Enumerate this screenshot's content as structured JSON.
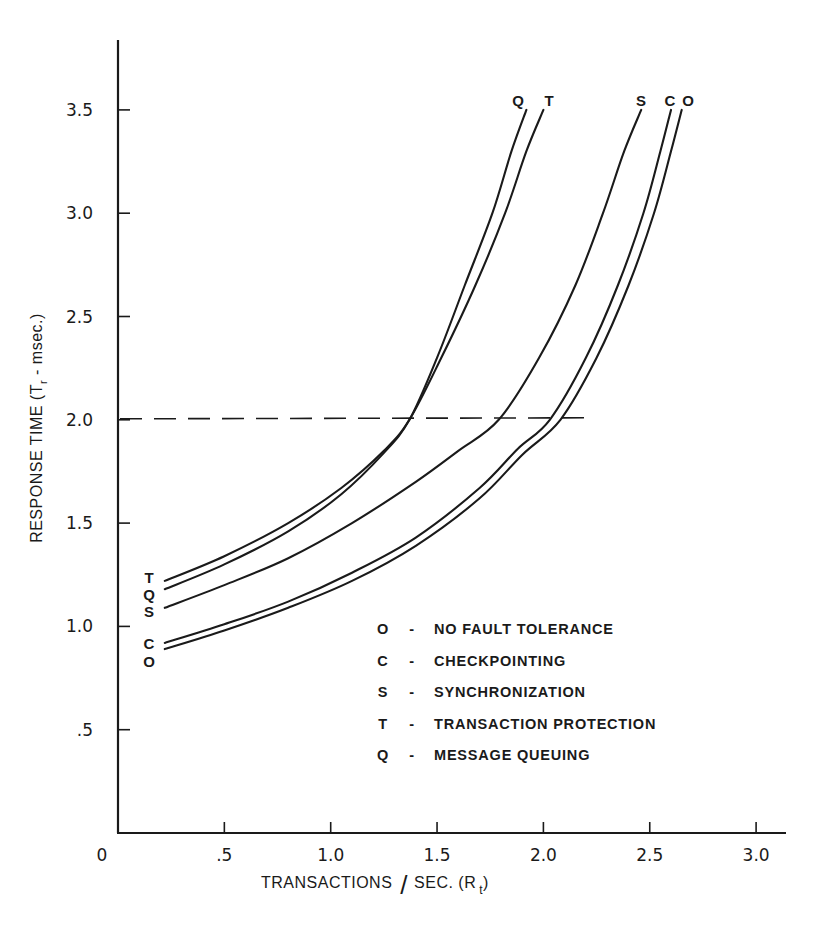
{
  "chart_data": {
    "type": "line",
    "title": "",
    "xlabel": "TRANSACTIONS / SEC. (R_t)",
    "xlabel_main": "TRANSACTIONS",
    "xlabel_slash": "/",
    "xlabel_unit": "SEC. (R",
    "xlabel_sub": "t",
    "xlabel_close": ")",
    "ylabel": "RESPONSE TIME (T_r - msec.)",
    "ylabel_main": "RESPONSE TIME (T",
    "ylabel_sub": "r",
    "ylabel_rest": " - msec.)",
    "xlim": [
      0,
      3.1
    ],
    "ylim": [
      0,
      3.8
    ],
    "grid": false,
    "x_ticks": [
      {
        "value": 0,
        "label": "0"
      },
      {
        "value": 0.5,
        "label": ".5"
      },
      {
        "value": 1.0,
        "label": "1.0"
      },
      {
        "value": 1.5,
        "label": "1.5"
      },
      {
        "value": 2.0,
        "label": "2.0"
      },
      {
        "value": 2.5,
        "label": "2.5"
      },
      {
        "value": 3.0,
        "label": "3.0"
      }
    ],
    "y_ticks": [
      {
        "value": 0.5,
        "label": ".5"
      },
      {
        "value": 1.0,
        "label": "1.0"
      },
      {
        "value": 1.5,
        "label": "1.5"
      },
      {
        "value": 2.0,
        "label": "2.0"
      },
      {
        "value": 2.5,
        "label": "2.5"
      },
      {
        "value": 3.0,
        "label": "3.0"
      },
      {
        "value": 3.5,
        "label": "3.5"
      }
    ],
    "reference_line": {
      "type": "horizontal",
      "style": "dashed",
      "y": 2.0,
      "x_start": 0,
      "x_end": 2.22
    },
    "series": [
      {
        "key": "O",
        "name": "NO FAULT TOLERANCE",
        "x": [
          0.22,
          0.5,
          0.8,
          1.1,
          1.4,
          1.7,
          1.9,
          2.08,
          2.25,
          2.4,
          2.52,
          2.6,
          2.65
        ],
        "y": [
          0.89,
          0.98,
          1.09,
          1.22,
          1.39,
          1.62,
          1.83,
          2.0,
          2.3,
          2.65,
          3.0,
          3.3,
          3.5
        ]
      },
      {
        "key": "C",
        "name": "CHECKPOINTING",
        "x": [
          0.22,
          0.5,
          0.8,
          1.1,
          1.4,
          1.7,
          1.88,
          2.03,
          2.2,
          2.35,
          2.47,
          2.55,
          2.6
        ],
        "y": [
          0.92,
          1.01,
          1.12,
          1.26,
          1.43,
          1.67,
          1.86,
          2.0,
          2.3,
          2.65,
          3.0,
          3.3,
          3.5
        ]
      },
      {
        "key": "S",
        "name": "SYNCHRONIZATION",
        "x": [
          0.22,
          0.5,
          0.8,
          1.1,
          1.4,
          1.6,
          1.79,
          1.98,
          2.15,
          2.28,
          2.38,
          2.46
        ],
        "y": [
          1.09,
          1.2,
          1.33,
          1.5,
          1.7,
          1.85,
          2.0,
          2.3,
          2.65,
          3.0,
          3.3,
          3.5
        ]
      },
      {
        "key": "T",
        "name": "TRANSACTION PROTECTION",
        "x": [
          0.22,
          0.5,
          0.8,
          1.05,
          1.25,
          1.37,
          1.52,
          1.68,
          1.82,
          1.92,
          2.0
        ],
        "y": [
          1.22,
          1.34,
          1.5,
          1.67,
          1.85,
          2.0,
          2.3,
          2.65,
          3.0,
          3.3,
          3.5
        ]
      },
      {
        "key": "Q",
        "name": "MESSAGE QUEUING",
        "x": [
          0.22,
          0.5,
          0.8,
          1.05,
          1.25,
          1.37,
          1.5,
          1.63,
          1.76,
          1.85,
          1.92
        ],
        "y": [
          1.18,
          1.3,
          1.46,
          1.64,
          1.84,
          2.0,
          2.3,
          2.65,
          3.0,
          3.3,
          3.5
        ]
      }
    ],
    "curve_start_labels_order_top_to_bottom": [
      "T",
      "Q",
      "S",
      "C",
      "O"
    ],
    "curve_end_labels_left_to_right": [
      "Q",
      "T",
      "S",
      "C",
      "O"
    ],
    "legend": {
      "position": "inside-lower-right",
      "entries": [
        {
          "key": "O",
          "dash": "-",
          "label": "NO FAULT TOLERANCE"
        },
        {
          "key": "C",
          "dash": "-",
          "label": "CHECKPOINTING"
        },
        {
          "key": "S",
          "dash": "-",
          "label": "SYNCHRONIZATION"
        },
        {
          "key": "T",
          "dash": "-",
          "label": "TRANSACTION PROTECTION"
        },
        {
          "key": "Q",
          "dash": "-",
          "label": "MESSAGE QUEUING"
        }
      ]
    },
    "colors": {
      "ink": "#1a1a1a",
      "background": "#ffffff"
    }
  }
}
